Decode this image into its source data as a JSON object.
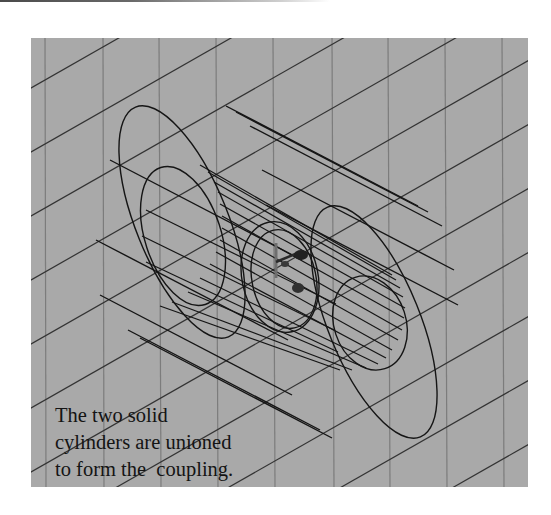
{
  "figure": {
    "caption_lines": [
      "The two solid",
      "cylinders are unioned",
      "to form the  coupling."
    ],
    "background_color": "#a9a9a9",
    "grid_line_color": "#7a7a7a",
    "diagonal_line_color": "#2e2e2e",
    "wireframe_color": "#151515",
    "objects": [
      "outer-cylinder",
      "inner-cylinder",
      "coordinate-axes-gizmo"
    ]
  }
}
